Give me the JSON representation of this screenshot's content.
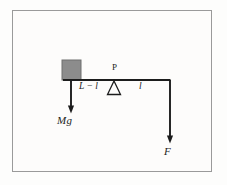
{
  "figure": {
    "type": "physics-free-body-diagram",
    "background_color": "#fdfcfb",
    "frame_color": "#9a9a9a",
    "line_color": "#1c1c1c",
    "block_fill_color": "#8c8c8c",
    "block_edge_color": "#6f6f6f"
  },
  "labels": {
    "left_span": "L − l",
    "right_span": "l",
    "pivot": "P",
    "weight_force": "Mg",
    "applied_force": "F"
  },
  "elements": {
    "block_name": "mass block",
    "beam_name": "rigid beam",
    "fulcrum_name": "triangular fulcrum",
    "weight_arrow_name": "downward weight arrow",
    "force_arrow_name": "downward applied force arrow"
  },
  "geometry": {
    "beam_y": 80,
    "beam_x_start": 63,
    "beam_x_end": 170,
    "pivot_x": 114,
    "block_x": 62,
    "block_y": 60,
    "block_width": 19,
    "block_height": 20,
    "weight_arrow_x": 71,
    "weight_arrow_y_end": 113,
    "force_arrow_x": 170,
    "force_arrow_y_end": 143
  }
}
